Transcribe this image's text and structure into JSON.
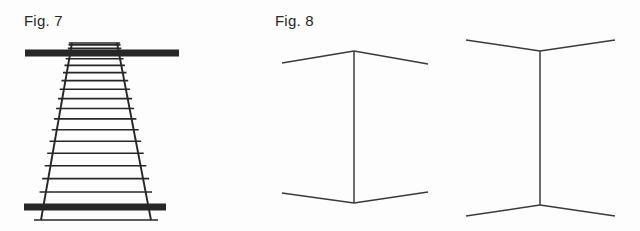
{
  "page": {
    "background_color": "#fdfdfd",
    "ink_color": "#272727",
    "line_color": "#3a3a3a",
    "width": 640,
    "height": 231
  },
  "figures": [
    {
      "id": "fig-7",
      "label": "Fig. 7",
      "label_x": 24,
      "label_y": 13,
      "illusion_name": "ponzo-railway-track-illusion",
      "description": "Converging railway track with two equal horizontal bars",
      "geometry": {
        "rail_top_left_x": 72,
        "rail_top_right_x": 117,
        "rail_top_y": 43,
        "rail_bottom_left_x": 41,
        "rail_bottom_right_x": 151,
        "rail_bottom_y": 220,
        "rail_stroke_width": 1.9,
        "tie_count": 20,
        "tie_overhang": 7,
        "tie_stroke_width": 1.6,
        "bar_top": {
          "x1": 25,
          "x2": 179,
          "y": 53,
          "thickness": 7
        },
        "bar_bottom": {
          "x1": 24,
          "x2": 166,
          "y": 207,
          "thickness": 7
        }
      }
    },
    {
      "id": "fig-8",
      "label": "Fig. 8",
      "label_x": 275,
      "label_y": 13,
      "illusion_name": "muller-lyer-illusion",
      "description": "Two equal vertical shafts with outward and inward pointing fins",
      "variants": [
        {
          "id": "fig-8-left",
          "fin_direction": "outward-wings",
          "shaft_x": 354,
          "shaft_top_y": 51,
          "shaft_bottom_y": 203,
          "top_fin_left_end_x": 282,
          "top_fin_left_end_y": 63,
          "top_fin_right_end_x": 428,
          "top_fin_right_end_y": 64,
          "bottom_fin_left_end_x": 282,
          "bottom_fin_left_end_y": 193,
          "bottom_fin_right_end_x": 428,
          "bottom_fin_right_end_y": 192,
          "stroke_width": 1.5
        },
        {
          "id": "fig-8-right",
          "fin_direction": "inward-arrowheads",
          "shaft_x": 540,
          "shaft_top_y": 51,
          "shaft_bottom_y": 205,
          "top_fin_left_end_x": 466,
          "top_fin_left_end_y": 40,
          "top_fin_right_end_x": 615,
          "top_fin_right_end_y": 40,
          "bottom_fin_left_end_x": 466,
          "bottom_fin_left_end_y": 216,
          "bottom_fin_right_end_x": 615,
          "bottom_fin_right_end_y": 216,
          "stroke_width": 1.5
        }
      ]
    }
  ]
}
